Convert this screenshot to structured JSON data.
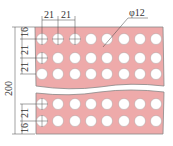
{
  "diagram": {
    "colors": {
      "plate_fill": "#eeaaaa",
      "plate_edge": "#888888",
      "hole_fill": "#ffffff",
      "line": "#444444"
    },
    "dimensions": {
      "hole_diameter": "φ12",
      "horizontal_pitch": [
        "21",
        "21"
      ],
      "vertical_top": [
        "16",
        "21",
        "21"
      ],
      "vertical_bottom": [
        "21",
        "16"
      ],
      "total_height": "200"
    },
    "grid": {
      "columns": 8,
      "rows_top": 3,
      "rows_bottom": 2,
      "break_line": true
    },
    "caption": ""
  }
}
